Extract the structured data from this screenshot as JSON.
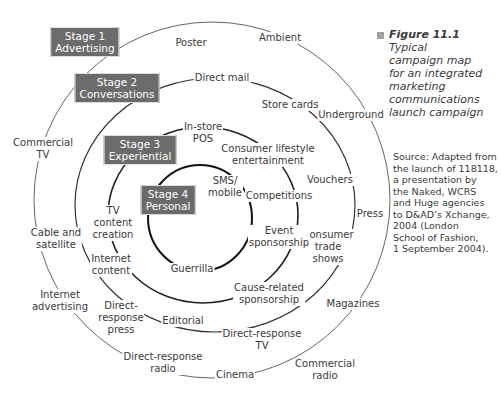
{
  "figure": {
    "number": "Figure 11.1",
    "caption": "Typical campaign map for an integrated marketing communications launch campaign",
    "caption_lines": [
      "Typical",
      "campaign map",
      "for an integrated",
      "marketing",
      "communications",
      "launch campaign"
    ],
    "source_lines": [
      "Source: Adapted from",
      "the launch of 118118,",
      "a presentation by",
      "the Naked, WCRS",
      "and Huge agencies",
      "to D&AD’s Xchange,",
      "2004 (London",
      "School of Fashion,",
      "1 September 2004)."
    ]
  },
  "stages": [
    {
      "line1": "Stage 1",
      "line2": "Advertising"
    },
    {
      "line1": "Stage 2",
      "line2": "Conversations"
    },
    {
      "line1": "Stage 3",
      "line2": "Experiential"
    },
    {
      "line1": "Stage 4",
      "line2": "Personal"
    }
  ],
  "ring_items": {
    "stage1": [
      "Poster",
      "Ambient",
      "Underground",
      "Press",
      "Commercial TV",
      "Cable and satellite",
      "Direct-response press"
    ],
    "stage2": [
      "Direct mail",
      "Store cards",
      "Vouchers",
      "Consumer trade shows",
      "Cause-related sponsorship",
      "Editorial",
      "Internet content"
    ],
    "stage3": [
      "In-store POS",
      "Consumer lifestyle entertainment",
      "Competitions",
      "Event sponsorship",
      "TV content creation"
    ],
    "stage4": [
      "SMS/ mobile",
      "Guerrilla"
    ],
    "outside": [
      "Internet advertising",
      "Magazines",
      "Direct-response TV",
      "Direct-response radio",
      "Cinema",
      "Commercial radio"
    ]
  },
  "labels": {
    "poster": "Poster",
    "ambient": "Ambient",
    "direct_mail": "Direct mail",
    "store_cards": "Store cards",
    "underground": "Underground",
    "in_store_1": "In-store",
    "in_store_2": "POS",
    "consumer_lifestyle_1": "Consumer lifestyle",
    "consumer_lifestyle_2": "entertainment",
    "commercial_tv_1": "Commercial",
    "commercial_tv_2": "TV",
    "sms_1": "SMS/",
    "sms_2": "mobile",
    "competitions": "Competitions",
    "vouchers": "Vouchers",
    "tv_content_1": "TV",
    "tv_content_2": "content",
    "tv_content_3": "creation",
    "event_1": "Event",
    "event_2": "sponsorship",
    "press": "Press",
    "cable_1": "Cable and",
    "cable_2": "satellite",
    "consumer_trade_1": "Consumer",
    "consumer_trade_2": "trade",
    "consumer_trade_3": "shows",
    "internet_content_1": "Internet",
    "internet_content_2": "content",
    "guerrilla": "Guerrilla",
    "cause_1": "Cause-related",
    "cause_2": "sponsorship",
    "internet_adv_1": "Internet",
    "internet_adv_2": "advertising",
    "magazines": "Magazines",
    "dr_press_1": "Direct-",
    "dr_press_2": "response",
    "dr_press_3": "press",
    "editorial": "Editorial",
    "dr_tv_1": "Direct-response",
    "dr_tv_2": "TV",
    "dr_radio_1": "Direct-response",
    "dr_radio_2": "radio",
    "cinema": "Cinema",
    "commercial_radio_1": "Commercial",
    "commercial_radio_2": "radio"
  },
  "colors": {
    "stage_box": "#6b6b6b",
    "stage_text": "#ffffff",
    "ring_line": "#3a3a3a",
    "caption_square": "#a0a0a0",
    "text": "#3a3a3a"
  }
}
